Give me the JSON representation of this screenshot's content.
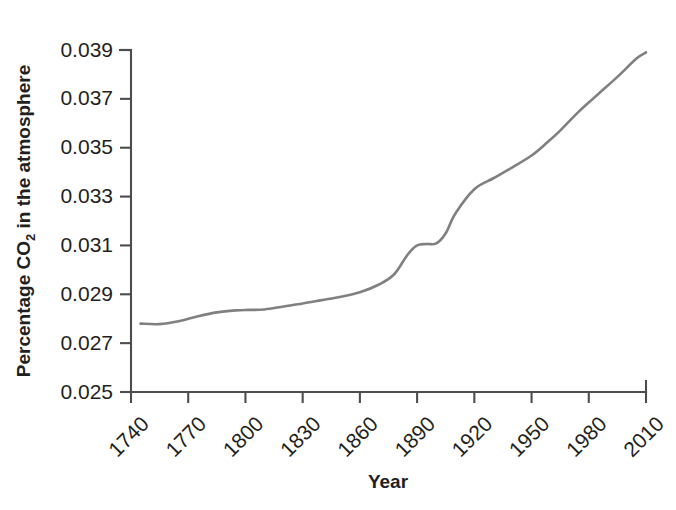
{
  "chart_data": {
    "type": "line",
    "title": "",
    "xlabel": "Year",
    "ylabel_prefix": "Percentage CO",
    "ylabel_sub": "2",
    "ylabel_suffix": " in the atmosphere",
    "ylabel_full": "Percentage CO2 in the atmosphere",
    "xlim": [
      1740,
      2010
    ],
    "ylim": [
      0.025,
      0.039
    ],
    "xticks": [
      1740,
      1770,
      1800,
      1830,
      1860,
      1890,
      1920,
      1950,
      1980,
      2010
    ],
    "xtick_labels": [
      "1740",
      "1770",
      "1800",
      "1830",
      "1860",
      "1890",
      "1920",
      "1950",
      "1980",
      "2010"
    ],
    "yticks": [
      0.025,
      0.027,
      0.029,
      0.031,
      0.033,
      0.035,
      0.037,
      0.039
    ],
    "ytick_labels": [
      "0.025",
      "0.027",
      "0.029",
      "0.031",
      "0.033",
      "0.035",
      "0.037",
      "0.039"
    ],
    "grid": false,
    "legend": "none",
    "line_color": "#808080",
    "axis_color": "#4d4d4d",
    "text_color": "#231f20",
    "background": "#ffffff",
    "series": [
      {
        "name": "Percentage CO2 in the atmosphere",
        "x": [
          1745,
          1755,
          1765,
          1775,
          1785,
          1795,
          1802,
          1810,
          1820,
          1830,
          1840,
          1850,
          1860,
          1870,
          1878,
          1885,
          1890,
          1895,
          1900,
          1905,
          1910,
          1920,
          1930,
          1940,
          1950,
          1958,
          1965,
          1975,
          1985,
          1995,
          2005,
          2010
        ],
        "y": [
          0.0278,
          0.02778,
          0.0279,
          0.0281,
          0.02826,
          0.02834,
          0.02836,
          0.02838,
          0.0285,
          0.02862,
          0.02876,
          0.0289,
          0.02908,
          0.0294,
          0.02982,
          0.03062,
          0.031,
          0.03106,
          0.03108,
          0.0315,
          0.0323,
          0.0333,
          0.03375,
          0.0342,
          0.03468,
          0.0352,
          0.0357,
          0.0365,
          0.0372,
          0.0379,
          0.03865,
          0.0389
        ]
      }
    ]
  },
  "axis_titles": {
    "x": "Year"
  }
}
